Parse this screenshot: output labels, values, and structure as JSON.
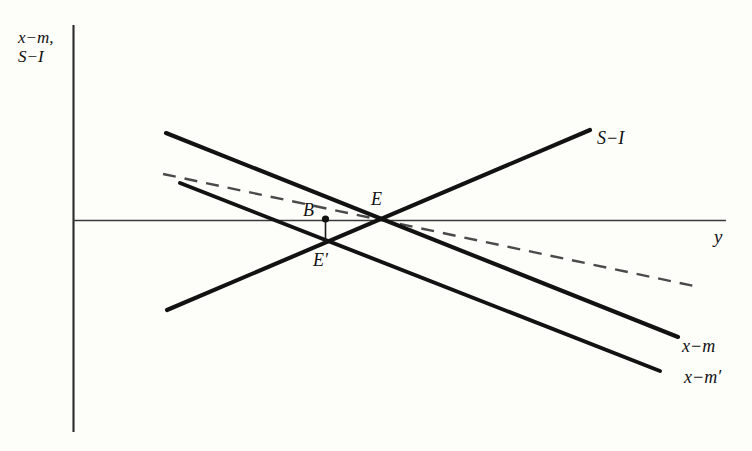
{
  "figure": {
    "type": "economics-line-diagram",
    "background_color": "#fdfdfa",
    "line_color": "#111111",
    "width": 752,
    "height": 451
  },
  "axes": {
    "y_label_line1": "x−m,",
    "y_label_line2": "S−I",
    "x_label": "y",
    "origin": {
      "x": 73,
      "y": 220
    },
    "y_axis_top": 25,
    "y_axis_bottom": 432,
    "x_axis_right": 726
  },
  "curves": [
    {
      "id": "s-minus-i",
      "label": "S−I",
      "style": "solid",
      "direction": "upward-sloping",
      "x1": 167,
      "y1": 310,
      "x2": 590,
      "y2": 130,
      "label_x": 597,
      "label_y": 130
    },
    {
      "id": "x-minus-m",
      "label": "x−m",
      "style": "solid",
      "direction": "downward-sloping",
      "x1": 166,
      "y1": 133,
      "x2": 678,
      "y2": 337,
      "label_x": 682,
      "label_y": 338
    },
    {
      "id": "x-minus-m-prime",
      "label": "x−m′",
      "style": "solid",
      "direction": "downward-sloping",
      "x1": 180,
      "y1": 183,
      "x2": 660,
      "y2": 371,
      "label_x": 684,
      "label_y": 370
    },
    {
      "id": "dashed-schedule",
      "label": "",
      "style": "dashed",
      "direction": "downward-sloping",
      "x1": 163,
      "y1": 174,
      "x2": 694,
      "y2": 286,
      "label_x": null,
      "label_y": null
    }
  ],
  "points": [
    {
      "id": "E",
      "label": "E",
      "x": 378,
      "y": 220,
      "marker": "intersection",
      "label_x": 371,
      "label_y": 192
    },
    {
      "id": "B",
      "label": "B",
      "x": 325,
      "y": 219,
      "marker": "dot",
      "label_x": 303,
      "label_y": 203
    },
    {
      "id": "E-prime",
      "label": "E′",
      "x": 325,
      "y": 241,
      "marker": "intersection",
      "label_x": 313,
      "label_y": 252
    }
  ],
  "connectors": [
    {
      "id": "b-to-eprime",
      "from": "B",
      "to": "E-prime",
      "style": "solid-thin",
      "x": 325,
      "y1": 221,
      "y2": 241
    }
  ]
}
